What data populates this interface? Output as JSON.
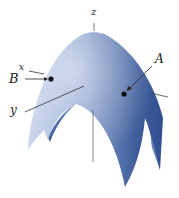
{
  "diagram": {
    "type": "3d-surface",
    "colors": {
      "surface_dark": "#2f4f8f",
      "surface_mid": "#6f8cc0",
      "surface_light": "#c9d6ec",
      "axis": "#333333",
      "point": "#111111"
    },
    "axes": {
      "z_label": "z",
      "x_label": "x",
      "y_label": "y"
    },
    "points": [
      {
        "label": "A"
      },
      {
        "label": "B"
      }
    ]
  }
}
